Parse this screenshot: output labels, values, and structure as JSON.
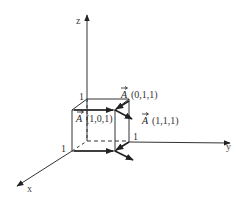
{
  "diagram": {
    "axes": {
      "x_label": "x",
      "y_label": "y",
      "z_label": "z"
    },
    "tick_labels": {
      "z_one": "1",
      "x_one": "1",
      "y_one": "1"
    },
    "vectors": [
      {
        "symbol": "A",
        "coords": "(0,1,1)"
      },
      {
        "symbol": "A",
        "coords": "(1,0,1)"
      },
      {
        "symbol": "A",
        "coords": "(1,1,1)"
      }
    ],
    "colors": {
      "line": "#222222",
      "background": "#ffffff"
    }
  }
}
